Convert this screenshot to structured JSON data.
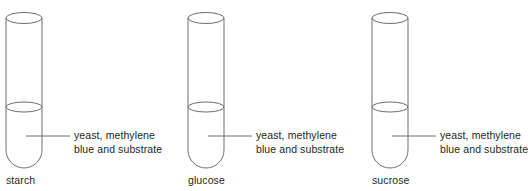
{
  "figure": {
    "type": "diagram",
    "stroke_color": "#6d6e71",
    "text_color": "#231f20",
    "background_color": "#ffffff",
    "annotation_line_1": "yeast, methylene",
    "annotation_line_2": "blue and substrate",
    "tubes": [
      {
        "id": "tube-starch",
        "substrate_label": "starch",
        "annotation_line_1": "yeast, methylene",
        "annotation_line_2": "blue and substrate",
        "left": 0,
        "tube_x": 6,
        "tube_width": 36,
        "top_y": 13,
        "liquid_y": 107,
        "bottom_y": 168,
        "leader_start_x": 26,
        "leader_end_x": 70,
        "leader_y": 136,
        "text_x": 74,
        "text_y": 129,
        "label_x": 6,
        "label_y": 174
      },
      {
        "id": "tube-glucose",
        "substrate_label": "glucose",
        "annotation_line_1": "yeast, methylene",
        "annotation_line_2": "blue and substrate",
        "left": 0,
        "tube_x": 188,
        "tube_width": 36,
        "top_y": 13,
        "liquid_y": 107,
        "bottom_y": 168,
        "leader_start_x": 208,
        "leader_end_x": 252,
        "leader_y": 136,
        "text_x": 256,
        "text_y": 129,
        "label_x": 188,
        "label_y": 174
      },
      {
        "id": "tube-sucrose",
        "substrate_label": "sucrose",
        "annotation_line_1": "yeast, methylene",
        "annotation_line_2": "blue and substrate",
        "left": 0,
        "tube_x": 372,
        "tube_width": 36,
        "top_y": 13,
        "liquid_y": 107,
        "bottom_y": 168,
        "leader_start_x": 392,
        "leader_end_x": 436,
        "leader_y": 136,
        "text_x": 440,
        "text_y": 129,
        "label_x": 372,
        "label_y": 174
      }
    ]
  }
}
